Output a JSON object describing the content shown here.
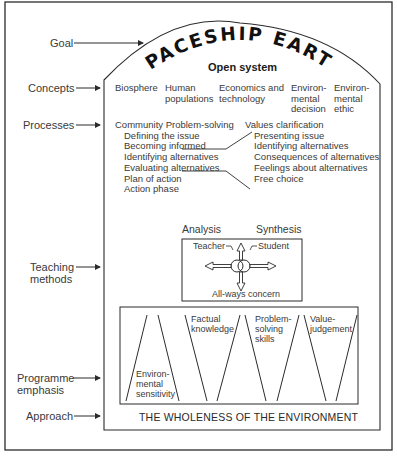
{
  "title": "SPACESHIP EARTH",
  "subtitle": "Open system",
  "row_labels": {
    "goal": "Goal",
    "concepts": "Concepts",
    "processes": "Processes",
    "teaching_1": "Teaching",
    "teaching_2": "methods",
    "emphasis_1": "Programme",
    "emphasis_2": "emphasis",
    "approach": "Approach"
  },
  "concepts": [
    {
      "l1": "Biosphere",
      "l2": "",
      "l3": ""
    },
    {
      "l1": "Human",
      "l2": "populations",
      "l3": ""
    },
    {
      "l1": "Economics and",
      "l2": "technology",
      "l3": ""
    },
    {
      "l1": "Environ-",
      "l2": "mental",
      "l3": "decision"
    },
    {
      "l1": "Environ-",
      "l2": "mental",
      "l3": "ethic"
    }
  ],
  "processes": {
    "community": {
      "heading": "Community Problem-solving",
      "steps": [
        "Defining the issue",
        "Becoming informed",
        "Identifying alternatives",
        "Evaluating alternatives",
        "Plan of action",
        "Action phase"
      ]
    },
    "values": {
      "heading": "Values clarification",
      "steps": [
        "Presenting issue",
        "Identifying alternatives",
        "Consequences of alternatives",
        "Feelings about alternatives",
        "Free choice"
      ]
    }
  },
  "teaching": {
    "analysis": "Analysis",
    "synthesis": "Synthesis",
    "teacher": "Teacher",
    "student": "Student",
    "concern": "All-ways concern"
  },
  "emphasis": {
    "sensitivity": [
      "Environ-",
      "mental",
      "sensitivity"
    ],
    "factual": [
      "Factual",
      "knowledge"
    ],
    "problem": [
      "Problem-",
      "solving",
      "skills"
    ],
    "value": [
      "Value-",
      "judgement"
    ]
  },
  "approach": "THE WHOLENESS OF THE ENVIRONMENT",
  "colors": {
    "line": "#2b2b2b",
    "text": "#3a3a3a",
    "background": "#ffffff"
  }
}
